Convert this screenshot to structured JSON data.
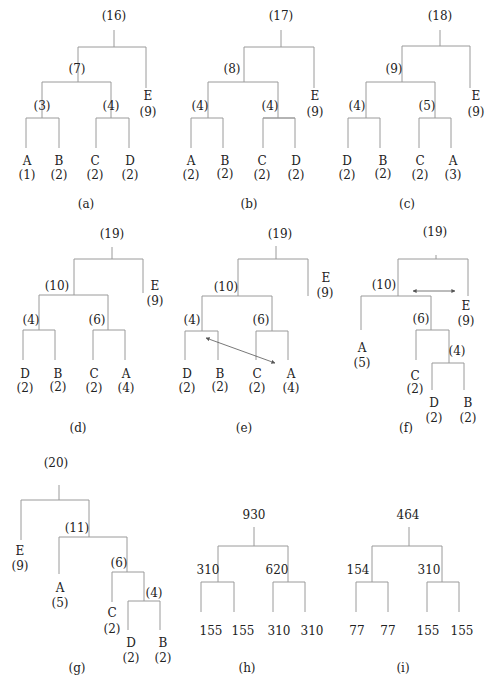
{
  "colors": {
    "line": "#9a9a9a",
    "text": "#222222",
    "arrow": "#555555"
  },
  "figures": [
    {
      "id": "a",
      "caption": "(a)",
      "nodes": [
        {
          "l": "(16)",
          "x": 114,
          "y": 20
        },
        {
          "l": "(7)",
          "x": 77,
          "y": 73
        },
        {
          "l": "(3)",
          "x": 42,
          "y": 110
        },
        {
          "l": "(4)",
          "x": 111,
          "y": 110
        },
        {
          "l": "E",
          "x": 148,
          "y": 100
        },
        {
          "l": "(9)",
          "x": 148,
          "y": 116
        },
        {
          "l": "A",
          "x": 27,
          "y": 165
        },
        {
          "l": "(1)",
          "x": 27,
          "y": 179
        },
        {
          "l": "B",
          "x": 59,
          "y": 165
        },
        {
          "l": "(2)",
          "x": 59,
          "y": 179
        },
        {
          "l": "C",
          "x": 95,
          "y": 165
        },
        {
          "l": "(2)",
          "x": 95,
          "y": 179
        },
        {
          "l": "D",
          "x": 130,
          "y": 165
        },
        {
          "l": "(2)",
          "x": 130,
          "y": 179
        }
      ],
      "cx": 86,
      "cy": 208,
      "edges": [
        [
          114,
          30,
          114,
          47
        ],
        [
          78,
          47,
          146,
          47
        ],
        [
          78,
          47,
          78,
          82
        ],
        [
          146,
          47,
          146,
          88
        ],
        [
          42,
          82,
          111,
          82
        ],
        [
          42,
          82,
          42,
          118
        ],
        [
          111,
          82,
          111,
          118
        ],
        [
          26,
          118,
          59,
          118
        ],
        [
          26,
          118,
          26,
          148
        ],
        [
          59,
          118,
          59,
          148
        ],
        [
          96,
          118,
          129,
          118
        ],
        [
          96,
          118,
          96,
          148
        ],
        [
          129,
          118,
          129,
          148
        ]
      ]
    },
    {
      "id": "b",
      "caption": "(b)",
      "nodes": [
        {
          "l": "(17)",
          "x": 281,
          "y": 20
        },
        {
          "l": "(8)",
          "x": 232,
          "y": 73
        },
        {
          "l": "(4)",
          "x": 200,
          "y": 110
        },
        {
          "l": "(4)",
          "x": 270,
          "y": 110
        },
        {
          "l": "E",
          "x": 315,
          "y": 100
        },
        {
          "l": "(9)",
          "x": 315,
          "y": 116
        },
        {
          "l": "A",
          "x": 191,
          "y": 165
        },
        {
          "l": "(2)",
          "x": 191,
          "y": 179
        },
        {
          "l": "B",
          "x": 225,
          "y": 165
        },
        {
          "l": "(2)",
          "x": 225,
          "y": 178
        },
        {
          "l": "C",
          "x": 262,
          "y": 165
        },
        {
          "l": "(2)",
          "x": 262,
          "y": 179
        },
        {
          "l": "D",
          "x": 296,
          "y": 165
        },
        {
          "l": "(2)",
          "x": 296,
          "y": 179
        }
      ],
      "cx": 249,
      "cy": 208,
      "edges": [
        [
          281,
          30,
          281,
          47
        ],
        [
          244,
          47,
          314,
          47
        ],
        [
          244,
          47,
          244,
          82
        ],
        [
          314,
          47,
          314,
          88
        ],
        [
          208,
          82,
          278,
          82
        ],
        [
          208,
          82,
          208,
          118
        ],
        [
          278,
          82,
          278,
          118
        ],
        [
          191,
          118,
          223,
          118
        ],
        [
          191,
          118,
          191,
          148
        ],
        [
          223,
          118,
          223,
          148
        ],
        [
          263,
          118,
          295,
          118
        ],
        [
          263,
          118,
          295,
          118
        ],
        [
          263,
          118,
          263,
          148
        ],
        [
          295,
          118,
          295,
          148
        ]
      ]
    },
    {
      "id": "c",
      "caption": "(c)",
      "nodes": [
        {
          "l": "(18)",
          "x": 440,
          "y": 20
        },
        {
          "l": "(9)",
          "x": 394,
          "y": 73
        },
        {
          "l": "(4)",
          "x": 357,
          "y": 110
        },
        {
          "l": "(5)",
          "x": 427,
          "y": 110
        },
        {
          "l": "E",
          "x": 476,
          "y": 100
        },
        {
          "l": "(9)",
          "x": 476,
          "y": 116
        },
        {
          "l": "D",
          "x": 347,
          "y": 165
        },
        {
          "l": "(2)",
          "x": 347,
          "y": 179
        },
        {
          "l": "B",
          "x": 383,
          "y": 165
        },
        {
          "l": "(2)",
          "x": 383,
          "y": 178
        },
        {
          "l": "C",
          "x": 420,
          "y": 165
        },
        {
          "l": "(2)",
          "x": 420,
          "y": 179
        },
        {
          "l": "A",
          "x": 453,
          "y": 165
        },
        {
          "l": "(3)",
          "x": 453,
          "y": 179
        }
      ],
      "cx": 407,
      "cy": 208,
      "edges": [
        [
          440,
          30,
          440,
          46
        ],
        [
          402,
          46,
          470,
          46
        ],
        [
          402,
          46,
          402,
          82
        ],
        [
          470,
          46,
          470,
          88
        ],
        [
          366,
          82,
          435,
          82
        ],
        [
          366,
          82,
          366,
          118
        ],
        [
          435,
          82,
          435,
          118
        ],
        [
          348,
          118,
          380,
          118
        ],
        [
          348,
          118,
          348,
          148
        ],
        [
          380,
          118,
          380,
          148
        ],
        [
          419,
          118,
          451,
          118
        ],
        [
          419,
          118,
          419,
          148
        ],
        [
          451,
          118,
          451,
          148
        ]
      ]
    },
    {
      "id": "d",
      "caption": "(d)",
      "nodes": [
        {
          "l": "(19)",
          "x": 112,
          "y": 238
        },
        {
          "l": "(10)",
          "x": 57,
          "y": 290
        },
        {
          "l": "(4)",
          "x": 31,
          "y": 324
        },
        {
          "l": "(6)",
          "x": 97,
          "y": 324
        },
        {
          "l": "E",
          "x": 155,
          "y": 290
        },
        {
          "l": "(9)",
          "x": 155,
          "y": 305
        },
        {
          "l": "D",
          "x": 25,
          "y": 378
        },
        {
          "l": "(2)",
          "x": 25,
          "y": 392
        },
        {
          "l": "B",
          "x": 58,
          "y": 378
        },
        {
          "l": "(2)",
          "x": 58,
          "y": 391
        },
        {
          "l": "C",
          "x": 94,
          "y": 378
        },
        {
          "l": "(2)",
          "x": 94,
          "y": 392
        },
        {
          "l": "A",
          "x": 126,
          "y": 378
        },
        {
          "l": "(4)",
          "x": 126,
          "y": 392
        }
      ],
      "cx": 78,
      "cy": 432,
      "edges": [
        [
          112,
          247,
          112,
          259
        ],
        [
          74,
          259,
          143,
          259
        ],
        [
          74,
          259,
          74,
          295
        ],
        [
          143,
          259,
          143,
          293
        ],
        [
          39,
          295,
          108,
          295
        ],
        [
          39,
          295,
          39,
          330
        ],
        [
          108,
          295,
          108,
          330
        ],
        [
          23,
          330,
          55,
          330
        ],
        [
          23,
          330,
          23,
          360
        ],
        [
          55,
          330,
          55,
          360
        ],
        [
          93,
          330,
          125,
          330
        ],
        [
          93,
          330,
          93,
          360
        ],
        [
          125,
          330,
          125,
          360
        ]
      ]
    },
    {
      "id": "e",
      "caption": "(e)",
      "nodes": [
        {
          "l": "(19)",
          "x": 280,
          "y": 238
        },
        {
          "l": "(10)",
          "x": 226,
          "y": 291
        },
        {
          "l": "(4)",
          "x": 192,
          "y": 324
        },
        {
          "l": "(6)",
          "x": 261,
          "y": 324
        },
        {
          "l": "E",
          "x": 326,
          "y": 282
        },
        {
          "l": "(9)",
          "x": 325,
          "y": 297
        },
        {
          "l": "D",
          "x": 187,
          "y": 378
        },
        {
          "l": "(2)",
          "x": 187,
          "y": 392
        },
        {
          "l": "B",
          "x": 220,
          "y": 378
        },
        {
          "l": "(2)",
          "x": 220,
          "y": 391
        },
        {
          "l": "C",
          "x": 257,
          "y": 378
        },
        {
          "l": "(2)",
          "x": 257,
          "y": 392
        },
        {
          "l": "A",
          "x": 291,
          "y": 378
        },
        {
          "l": "(4)",
          "x": 291,
          "y": 392
        }
      ],
      "cx": 244,
      "cy": 432,
      "edges": [
        [
          276,
          246,
          276,
          259
        ],
        [
          238,
          259,
          308,
          259
        ],
        [
          238,
          259,
          238,
          296
        ],
        [
          308,
          259,
          308,
          296
        ],
        [
          202,
          296,
          272,
          296
        ],
        [
          202,
          296,
          202,
          331
        ],
        [
          272,
          296,
          272,
          331
        ],
        [
          185,
          331,
          218,
          331
        ],
        [
          185,
          331,
          185,
          360
        ],
        [
          218,
          331,
          218,
          360
        ],
        [
          256,
          331,
          288,
          331
        ],
        [
          256,
          331,
          256,
          360
        ],
        [
          288,
          331,
          288,
          360
        ]
      ],
      "arrow": [
        275,
        363,
        206,
        338
      ]
    },
    {
      "id": "f",
      "caption": "(f)",
      "nodes": [
        {
          "l": "(19)",
          "x": 435,
          "y": 236
        },
        {
          "l": "(10)",
          "x": 384,
          "y": 289
        },
        {
          "l": "(6)",
          "x": 421,
          "y": 323
        },
        {
          "l": "(4)",
          "x": 457,
          "y": 355
        },
        {
          "l": "E",
          "x": 466,
          "y": 310
        },
        {
          "l": "(9)",
          "x": 466,
          "y": 325
        },
        {
          "l": "A",
          "x": 362,
          "y": 352
        },
        {
          "l": "(5)",
          "x": 362,
          "y": 367
        },
        {
          "l": "C",
          "x": 415,
          "y": 380
        },
        {
          "l": "(2)",
          "x": 415,
          "y": 393
        },
        {
          "l": "D",
          "x": 434,
          "y": 407
        },
        {
          "l": "(2)",
          "x": 434,
          "y": 422
        },
        {
          "l": "B",
          "x": 468,
          "y": 407
        },
        {
          "l": "(2)",
          "x": 468,
          "y": 422
        }
      ],
      "cx": 406,
      "cy": 432,
      "edges": [
        [
          436,
          255,
          436,
          259
        ],
        [
          398,
          259,
          468,
          259
        ],
        [
          398,
          259,
          398,
          296
        ],
        [
          468,
          259,
          468,
          296
        ],
        [
          361,
          296,
          431,
          296
        ],
        [
          361,
          296,
          361,
          330
        ],
        [
          431,
          296,
          431,
          330
        ],
        [
          416,
          330,
          449,
          330
        ],
        [
          416,
          330,
          416,
          360
        ],
        [
          449,
          330,
          449,
          363
        ],
        [
          432,
          363,
          464,
          363
        ],
        [
          432,
          363,
          432,
          390
        ],
        [
          464,
          363,
          464,
          390
        ]
      ],
      "arrow": [
        413,
        291,
        455,
        291
      ]
    },
    {
      "id": "g",
      "caption": "(g)",
      "nodes": [
        {
          "l": "(20)",
          "x": 56,
          "y": 467
        },
        {
          "l": "(11)",
          "x": 77,
          "y": 532
        },
        {
          "l": "(6)",
          "x": 119,
          "y": 567
        },
        {
          "l": "(4)",
          "x": 154,
          "y": 597
        },
        {
          "l": "E",
          "x": 20,
          "y": 555
        },
        {
          "l": "(9)",
          "x": 20,
          "y": 570
        },
        {
          "l": "A",
          "x": 60,
          "y": 592
        },
        {
          "l": "(5)",
          "x": 60,
          "y": 607
        },
        {
          "l": "C",
          "x": 112,
          "y": 617
        },
        {
          "l": "(2)",
          "x": 112,
          "y": 633
        },
        {
          "l": "D",
          "x": 131,
          "y": 647
        },
        {
          "l": "(2)",
          "x": 131,
          "y": 662
        },
        {
          "l": "B",
          "x": 163,
          "y": 647
        },
        {
          "l": "(2)",
          "x": 163,
          "y": 662
        }
      ],
      "cx": 77,
      "cy": 672,
      "edges": [
        [
          59,
          485,
          59,
          500
        ],
        [
          21,
          500,
          89,
          500
        ],
        [
          21,
          500,
          21,
          540
        ],
        [
          89,
          500,
          89,
          537
        ],
        [
          59,
          537,
          127,
          537
        ],
        [
          59,
          537,
          59,
          574
        ],
        [
          127,
          537,
          127,
          572
        ],
        [
          112,
          572,
          144,
          572
        ],
        [
          112,
          572,
          112,
          602
        ],
        [
          144,
          572,
          144,
          601
        ],
        [
          128,
          601,
          160,
          601
        ],
        [
          128,
          601,
          128,
          630
        ],
        [
          160,
          601,
          160,
          630
        ]
      ]
    },
    {
      "id": "h",
      "caption": "(h)",
      "nodes": [
        {
          "l": "930",
          "x": 254,
          "y": 519
        },
        {
          "l": "310",
          "x": 208,
          "y": 574
        },
        {
          "l": "620",
          "x": 277,
          "y": 574
        },
        {
          "l": "155",
          "x": 211,
          "y": 635
        },
        {
          "l": "155",
          "x": 243,
          "y": 635
        },
        {
          "l": "310",
          "x": 279,
          "y": 635
        },
        {
          "l": "310",
          "x": 312,
          "y": 635
        }
      ],
      "cx": 247,
      "cy": 672,
      "edges": [
        [
          254,
          527,
          254,
          546
        ],
        [
          218,
          546,
          288,
          546
        ],
        [
          218,
          546,
          218,
          582
        ],
        [
          288,
          546,
          288,
          582
        ],
        [
          201,
          582,
          234,
          582
        ],
        [
          201,
          582,
          201,
          612
        ],
        [
          234,
          582,
          234,
          612
        ],
        [
          273,
          582,
          305,
          582
        ],
        [
          273,
          582,
          273,
          612
        ],
        [
          305,
          582,
          305,
          612
        ]
      ]
    },
    {
      "id": "i",
      "caption": "(i)",
      "nodes": [
        {
          "l": "464",
          "x": 408,
          "y": 519
        },
        {
          "l": "310",
          "x": 429,
          "y": 574
        },
        {
          "l": "154",
          "x": 358,
          "y": 574
        },
        {
          "l": "77",
          "x": 357,
          "y": 635
        },
        {
          "l": "77",
          "x": 388,
          "y": 635
        },
        {
          "l": "155",
          "x": 428,
          "y": 635
        },
        {
          "l": "155",
          "x": 462,
          "y": 635
        }
      ],
      "cx": 403,
      "cy": 672,
      "edges": [
        [
          409,
          527,
          409,
          546
        ],
        [
          372,
          546,
          442,
          546
        ],
        [
          372,
          546,
          372,
          582
        ],
        [
          442,
          546,
          442,
          582
        ],
        [
          356,
          582,
          388,
          582
        ],
        [
          356,
          582,
          356,
          612
        ],
        [
          388,
          582,
          388,
          612
        ],
        [
          427,
          582,
          459,
          582
        ],
        [
          427,
          582,
          427,
          612
        ],
        [
          459,
          582,
          459,
          612
        ]
      ]
    }
  ]
}
